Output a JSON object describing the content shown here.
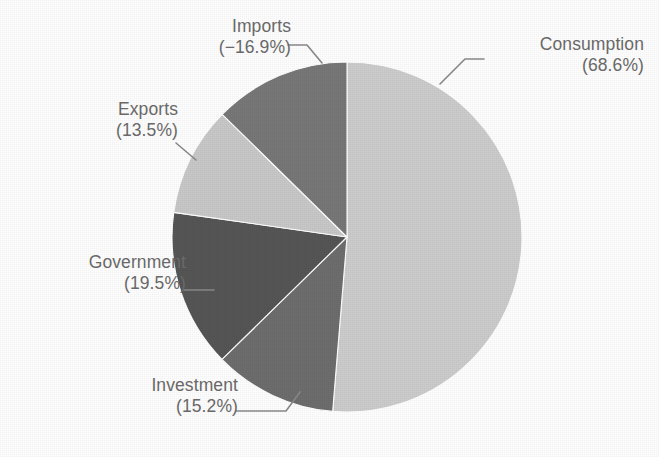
{
  "chart_data": {
    "type": "pie",
    "title": "",
    "subtitle": "",
    "xlabel": "",
    "ylabel": "",
    "legend_position": "callout-labels",
    "grid": false,
    "label_format": "category + (percent%)",
    "start_angle_deg": 0,
    "direction": "clockwise",
    "center": {
      "x": 347,
      "y": 237,
      "radius": 175
    },
    "categories": [
      "Consumption",
      "Investment",
      "Government",
      "Exports",
      "Imports"
    ],
    "values": [
      68.6,
      15.2,
      19.5,
      13.5,
      -16.9
    ],
    "display_values": [
      "68.6%",
      "15.2%",
      "19.5%",
      "13.5%",
      "−16.9%"
    ],
    "magnitudes": [
      68.6,
      15.2,
      19.5,
      13.5,
      16.9
    ],
    "magnitude_total": 133.7,
    "slices": [
      {
        "name": "Consumption",
        "label": "Consumption",
        "value_text": "(68.6%)",
        "value": 68.6,
        "magnitude": 68.6,
        "color": "#cdcdcd",
        "start_deg": 0.0,
        "end_deg": 184.7,
        "sweep_deg": 184.7
      },
      {
        "name": "Investment",
        "label": "Investment",
        "value_text": "(15.2%)",
        "value": 15.2,
        "magnitude": 15.2,
        "color": "#6e6e6e",
        "start_deg": 184.7,
        "end_deg": 225.6,
        "sweep_deg": 40.9
      },
      {
        "name": "Government",
        "label": "Government",
        "value_text": "(19.5%)",
        "value": 19.5,
        "magnitude": 19.5,
        "color": "#565656",
        "start_deg": 225.6,
        "end_deg": 278.1,
        "sweep_deg": 52.5
      },
      {
        "name": "Exports",
        "label": "Exports",
        "value_text": "(13.5%)",
        "value": 13.5,
        "magnitude": 13.5,
        "color": "#c9c9c9",
        "start_deg": 278.1,
        "end_deg": 314.5,
        "sweep_deg": 36.4
      },
      {
        "name": "Imports",
        "label": "Imports",
        "value_text": "(−16.9%)",
        "value": -16.9,
        "magnitude": 16.9,
        "color": "#787878",
        "start_deg": 314.5,
        "end_deg": 360.0,
        "sweep_deg": 45.5
      }
    ]
  },
  "callouts": {
    "consumption": {
      "label": "Consumption",
      "value_text": "(68.6%)"
    },
    "investment": {
      "label": "Investment",
      "value_text": "(15.2%)"
    },
    "government": {
      "label": "Government",
      "value_text": "(19.5%)"
    },
    "exports": {
      "label": "Exports",
      "value_text": "(13.5%)"
    },
    "imports": {
      "label": "Imports",
      "value_text": "(−16.9%)"
    }
  },
  "style": {
    "background": "#ffffff",
    "text_color": "#6b6b6b",
    "leader_color": "#8a8a8a"
  }
}
